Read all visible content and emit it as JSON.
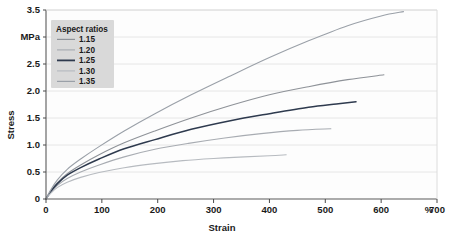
{
  "chart_data": {
    "type": "line",
    "title": "",
    "xlabel": "Strain",
    "ylabel": "Stress",
    "x_unit": "%",
    "y_unit": "MPa",
    "xlim": [
      0,
      700
    ],
    "ylim": [
      0,
      3.5
    ],
    "xticks": [
      "0",
      "100",
      "200",
      "300",
      "400",
      "500",
      "600",
      "700"
    ],
    "xtick_values": [
      0,
      100,
      200,
      300,
      400,
      500,
      600,
      700
    ],
    "yticks": [
      "0",
      "0.5",
      "1.0",
      "1.5",
      "2.0",
      "2.5",
      "MPa",
      "3.5"
    ],
    "ytick_values": [
      0,
      0.5,
      1.0,
      1.5,
      2.0,
      2.5,
      3.0,
      3.5
    ],
    "grid": "horizontal",
    "legend_position": "top-left",
    "legend_title": "Aspect ratios",
    "series": [
      {
        "name": "1.15",
        "color": "#8e9298",
        "width": 1.15,
        "x": [
          0,
          8,
          20,
          38,
          62,
          95,
          140,
          195,
          260,
          330,
          400,
          470,
          540,
          605
        ],
        "y": [
          0,
          0.14,
          0.3,
          0.47,
          0.63,
          0.82,
          1.04,
          1.26,
          1.5,
          1.73,
          1.93,
          2.08,
          2.21,
          2.3
        ]
      },
      {
        "name": "1.20",
        "color": "#a8acb2",
        "width": 1.2,
        "x": [
          0,
          8,
          20,
          38,
          62,
          95,
          140,
          195,
          255,
          320,
          385,
          450,
          510
        ],
        "y": [
          0,
          0.12,
          0.25,
          0.38,
          0.5,
          0.63,
          0.78,
          0.92,
          1.03,
          1.13,
          1.21,
          1.27,
          1.3
        ]
      },
      {
        "name": "1.25",
        "color": "#2e3a4e",
        "width": 1.25,
        "x": [
          0,
          8,
          20,
          38,
          62,
          95,
          140,
          195,
          260,
          330,
          400,
          470,
          520,
          555
        ],
        "y": [
          0,
          0.13,
          0.28,
          0.44,
          0.58,
          0.74,
          0.93,
          1.1,
          1.29,
          1.45,
          1.58,
          1.7,
          1.76,
          1.8
        ]
      },
      {
        "name": "1.30",
        "color": "#b7bbc0",
        "width": 1.3,
        "x": [
          0,
          8,
          20,
          38,
          62,
          95,
          140,
          190,
          245,
          300,
          355,
          400,
          430
        ],
        "y": [
          0,
          0.1,
          0.21,
          0.31,
          0.4,
          0.49,
          0.58,
          0.65,
          0.71,
          0.75,
          0.78,
          0.8,
          0.82
        ]
      },
      {
        "name": "1.35",
        "color": "#9aa0a8",
        "width": 1.35,
        "x": [
          0,
          8,
          20,
          38,
          62,
          95,
          140,
          195,
          260,
          330,
          400,
          470,
          540,
          600,
          640
        ],
        "y": [
          0,
          0.16,
          0.35,
          0.55,
          0.74,
          0.97,
          1.26,
          1.58,
          1.93,
          2.28,
          2.62,
          2.93,
          3.21,
          3.39,
          3.47
        ]
      }
    ]
  },
  "legend": {
    "title": "Aspect ratios",
    "items": [
      {
        "label": "1.15",
        "color": "#8e9298"
      },
      {
        "label": "1.20",
        "color": "#a8acb2"
      },
      {
        "label": "1.25",
        "color": "#2e3a4e"
      },
      {
        "label": "1.30",
        "color": "#b7bbc0"
      },
      {
        "label": "1.35",
        "color": "#9aa0a8"
      }
    ]
  },
  "style": {
    "plot_background": "#fdfdfd",
    "grid_color": "#e6e6e6",
    "axis_color": "#4a4a4a",
    "legend_background": "#d9d9d9",
    "page_background": "#ffffff"
  }
}
